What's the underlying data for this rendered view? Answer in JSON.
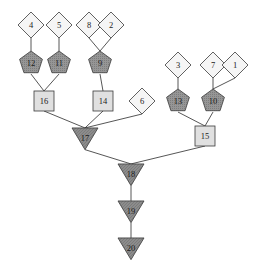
{
  "diagram": {
    "width": 263,
    "height": 274,
    "background": "#ffffff",
    "edge_color": "#2b2b2b",
    "stroke_color": "#3a3a3a",
    "label_color": "#1a1a1a",
    "shape_colors": {
      "diamond": "#f5f5f5",
      "square": "#e0e0e0",
      "pentagon": "#969696",
      "triangle": "#8c8c8c"
    },
    "nodes": [
      {
        "id": "n4",
        "label": "4",
        "shape": "diamond",
        "x": 31,
        "y": 25,
        "size": 13
      },
      {
        "id": "n5",
        "label": "5",
        "shape": "diamond",
        "x": 59,
        "y": 25,
        "size": 13
      },
      {
        "id": "n8",
        "label": "8",
        "shape": "diamond",
        "x": 89,
        "y": 25,
        "size": 13
      },
      {
        "id": "n2",
        "label": "2",
        "shape": "diamond",
        "x": 111,
        "y": 25,
        "size": 13
      },
      {
        "id": "n3",
        "label": "3",
        "shape": "diamond",
        "x": 178,
        "y": 65,
        "size": 13
      },
      {
        "id": "n7",
        "label": "7",
        "shape": "diamond",
        "x": 213,
        "y": 65,
        "size": 13
      },
      {
        "id": "n1",
        "label": "1",
        "shape": "diamond",
        "x": 235,
        "y": 65,
        "size": 13
      },
      {
        "id": "n6",
        "label": "6",
        "shape": "diamond",
        "x": 142,
        "y": 101,
        "size": 13
      },
      {
        "id": "n12",
        "label": "12",
        "shape": "pentagon",
        "x": 31,
        "y": 63,
        "size": 12
      },
      {
        "id": "n11",
        "label": "11",
        "shape": "pentagon",
        "x": 59,
        "y": 63,
        "size": 12
      },
      {
        "id": "n9",
        "label": "9",
        "shape": "pentagon",
        "x": 100,
        "y": 63,
        "size": 12
      },
      {
        "id": "n13",
        "label": "13",
        "shape": "pentagon",
        "x": 178,
        "y": 101,
        "size": 12
      },
      {
        "id": "n10",
        "label": "10",
        "shape": "pentagon",
        "x": 213,
        "y": 101,
        "size": 12
      },
      {
        "id": "n16",
        "label": "16",
        "shape": "square",
        "x": 44,
        "y": 101,
        "size": 10
      },
      {
        "id": "n14",
        "label": "14",
        "shape": "square",
        "x": 103,
        "y": 101,
        "size": 10
      },
      {
        "id": "n15",
        "label": "15",
        "shape": "square",
        "x": 205,
        "y": 136,
        "size": 10
      },
      {
        "id": "n17",
        "label": "17",
        "shape": "triangle",
        "x": 85,
        "y": 136,
        "size": 13
      },
      {
        "id": "n18",
        "label": "18",
        "shape": "triangle",
        "x": 131,
        "y": 172,
        "size": 13
      },
      {
        "id": "n19",
        "label": "19",
        "shape": "triangle",
        "x": 131,
        "y": 209,
        "size": 13
      },
      {
        "id": "n20",
        "label": "20",
        "shape": "triangle",
        "x": 131,
        "y": 246,
        "size": 13
      }
    ],
    "edges": [
      {
        "from": "n4",
        "to": "n12"
      },
      {
        "from": "n5",
        "to": "n11"
      },
      {
        "from": "n8",
        "to": "n9"
      },
      {
        "from": "n2",
        "to": "n9"
      },
      {
        "from": "n12",
        "to": "n16"
      },
      {
        "from": "n11",
        "to": "n16"
      },
      {
        "from": "n9",
        "to": "n14"
      },
      {
        "from": "n16",
        "to": "n17"
      },
      {
        "from": "n14",
        "to": "n17"
      },
      {
        "from": "n6",
        "to": "n17"
      },
      {
        "from": "n3",
        "to": "n13"
      },
      {
        "from": "n7",
        "to": "n10"
      },
      {
        "from": "n1",
        "to": "n10"
      },
      {
        "from": "n13",
        "to": "n15"
      },
      {
        "from": "n10",
        "to": "n15"
      },
      {
        "from": "n17",
        "to": "n18"
      },
      {
        "from": "n15",
        "to": "n18"
      },
      {
        "from": "n18",
        "to": "n19"
      },
      {
        "from": "n19",
        "to": "n20"
      }
    ]
  }
}
